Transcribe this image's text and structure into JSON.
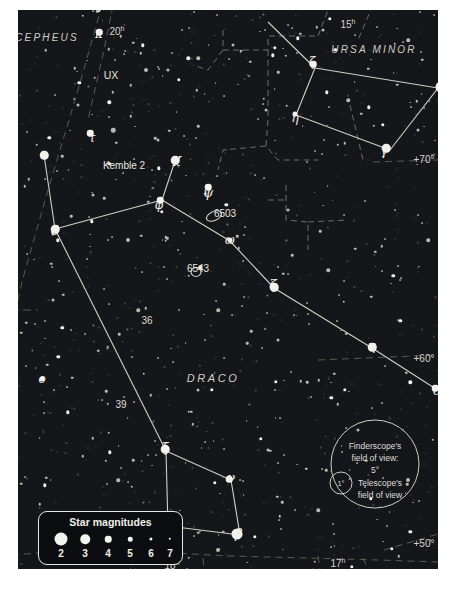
{
  "chart_data": {
    "type": "scatter",
    "xlabel": "Right Ascension",
    "ylabel": "Declination",
    "grid": true,
    "legend_position": "bottom-left",
    "ra_ticks": [
      "20ʰ",
      "15ʰ",
      "18ʰ",
      "17ʰ"
    ],
    "dec_ticks": [
      "+70°",
      "+60°",
      "+50°"
    ],
    "constellations": [
      "DRACO",
      "URSA MINOR",
      "CEPHEUS"
    ],
    "magnitude_scale": [
      2,
      3,
      4,
      5,
      6,
      7
    ],
    "deep_sky_objects": [
      "6503",
      "6543"
    ],
    "asterisms": [
      "Kemble 2"
    ],
    "variable_stars": [
      "UX"
    ],
    "flamsteed_stars": [
      "36",
      "39"
    ],
    "named_stars": [
      {
        "label": "κ",
        "constellation": "CEPHEUS",
        "x": 99,
        "y": 32,
        "mag": 4
      },
      {
        "label": "τ",
        "constellation": "DRACO",
        "x": 90,
        "y": 133,
        "mag": 4
      },
      {
        "label": "ε",
        "constellation": "DRACO",
        "x": 44,
        "y": 155,
        "mag": 3
      },
      {
        "label": "χ",
        "constellation": "DRACO",
        "x": 175,
        "y": 160,
        "mag": 3
      },
      {
        "label": "ψ",
        "constellation": "DRACO",
        "x": 208,
        "y": 187,
        "mag": 4
      },
      {
        "label": "φ",
        "constellation": "DRACO",
        "x": 160,
        "y": 200,
        "mag": 4
      },
      {
        "label": "δ",
        "constellation": "DRACO",
        "x": 55,
        "y": 229,
        "mag": 3
      },
      {
        "label": "ω",
        "constellation": "DRACO",
        "x": 230,
        "y": 240,
        "mag": 5
      },
      {
        "label": "ζ",
        "constellation": "DRACO",
        "x": 274,
        "y": 287,
        "mag": 3
      },
      {
        "label": "η",
        "constellation": "DRACO",
        "x": 372,
        "y": 347,
        "mag": 3
      },
      {
        "label": "θ",
        "constellation": "DRACO",
        "x": 435,
        "y": 388,
        "mag": 4
      },
      {
        "label": "o",
        "constellation": "DRACO",
        "x": 42,
        "y": 379,
        "mag": 5
      },
      {
        "label": "ξ",
        "constellation": "DRACO",
        "x": 165,
        "y": 449,
        "mag": 3
      },
      {
        "label": "ν",
        "constellation": "DRACO",
        "x": 229,
        "y": 479,
        "mag": 4
      },
      {
        "label": "γ",
        "constellation": "DRACO",
        "x": 166,
        "y": 525,
        "mag": 2
      },
      {
        "label": "β",
        "constellation": "DRACO",
        "x": 237,
        "y": 534,
        "mag": 2
      },
      {
        "label": "ζ",
        "constellation": "URSA MINOR",
        "x": 313,
        "y": 64,
        "mag": 4
      },
      {
        "label": "η",
        "constellation": "URSA MINOR",
        "x": 295,
        "y": 114,
        "mag": 5
      },
      {
        "label": "β",
        "constellation": "URSA MINOR",
        "x": 441,
        "y": 87,
        "mag": 2
      },
      {
        "label": "γ",
        "constellation": "URSA MINOR",
        "x": 386,
        "y": 148,
        "mag": 3
      }
    ]
  },
  "legend": {
    "title": "Star magnitudes",
    "magnitudes": [
      "2",
      "3",
      "4",
      "5",
      "6",
      "7"
    ]
  },
  "fov": {
    "finder_line1": "Finderscope's",
    "finder_line2": "field of view:",
    "finder_value": "5°",
    "scope_line1": "Telescope's",
    "scope_line2": "field of view",
    "scope_value": "1°"
  },
  "labels": {
    "constellations": [
      {
        "name": "CEPHEUS",
        "x": 47,
        "y": 37
      },
      {
        "name": "URSA MINOR",
        "x": 374,
        "y": 49
      },
      {
        "name": "DRACO",
        "x": 213,
        "y": 378
      }
    ],
    "stars": [
      {
        "text": "κ",
        "x": 99,
        "y": 34,
        "size": "normal"
      },
      {
        "text": "τ",
        "x": 92,
        "y": 138,
        "size": "normal"
      },
      {
        "text": "ε",
        "x": 44,
        "y": 155,
        "size": "normal"
      },
      {
        "text": "χ",
        "x": 177,
        "y": 158,
        "size": "big"
      },
      {
        "text": "ψ",
        "x": 208,
        "y": 192,
        "size": "big"
      },
      {
        "text": "φ",
        "x": 159,
        "y": 205,
        "size": "normal"
      },
      {
        "text": "δ",
        "x": 55,
        "y": 230,
        "size": "big"
      },
      {
        "text": "ω",
        "x": 230,
        "y": 240,
        "size": "normal"
      },
      {
        "text": "ζ",
        "x": 273,
        "y": 284,
        "size": "big"
      },
      {
        "text": "η",
        "x": 372,
        "y": 345,
        "size": "big"
      },
      {
        "text": "θ",
        "x": 437,
        "y": 390,
        "size": "big"
      },
      {
        "text": "o",
        "x": 42,
        "y": 379,
        "size": "normal"
      },
      {
        "text": "ξ",
        "x": 165,
        "y": 447,
        "size": "big"
      },
      {
        "text": "ν",
        "x": 231,
        "y": 477,
        "size": "big"
      },
      {
        "text": "γ",
        "x": 167,
        "y": 522,
        "size": "big"
      },
      {
        "text": "β",
        "x": 239,
        "y": 533,
        "size": "big"
      },
      {
        "text": "ζ",
        "x": 312,
        "y": 62,
        "size": "normal"
      },
      {
        "text": "η",
        "x": 295,
        "y": 118,
        "size": "normal"
      },
      {
        "text": "β",
        "x": 443,
        "y": 87,
        "size": "big"
      },
      {
        "text": "γ",
        "x": 384,
        "y": 151,
        "size": "normal"
      }
    ],
    "numbers": [
      {
        "text": "36",
        "x": 147,
        "y": 320
      },
      {
        "text": "39",
        "x": 121,
        "y": 404
      }
    ],
    "ngc": [
      {
        "text": "6503",
        "x": 225,
        "y": 213
      },
      {
        "text": "6543",
        "x": 198,
        "y": 268
      }
    ],
    "variable": [
      {
        "text": "UX",
        "x": 111,
        "y": 75
      }
    ],
    "asterism": [
      {
        "text": "Kemble 2",
        "x": 124,
        "y": 165
      }
    ],
    "ra": [
      {
        "text": "20",
        "sup": "h",
        "x": 117,
        "y": 31
      },
      {
        "text": "15",
        "sup": "h",
        "x": 348,
        "y": 24
      },
      {
        "text": "18",
        "sup": "h",
        "x": 172,
        "y": 565
      },
      {
        "text": "17",
        "sup": "h",
        "x": 338,
        "y": 563
      }
    ],
    "dec": [
      {
        "text": "+70°",
        "x": 424,
        "y": 159
      },
      {
        "text": "+60°",
        "x": 424,
        "y": 358
      },
      {
        "text": "+50°",
        "x": 424,
        "y": 543
      }
    ]
  }
}
